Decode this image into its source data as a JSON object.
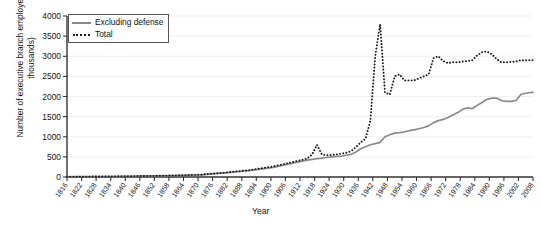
{
  "chart_data": {
    "type": "line",
    "title": "",
    "xlabel": "Year",
    "ylabel": "Number of executive branch employees (in thousands)",
    "xlim": [
      1816,
      2008
    ],
    "ylim": [
      0,
      4000
    ],
    "grid": true,
    "legend_position": "top-left",
    "ytick_labels": [
      "0",
      "500",
      "1000",
      "1500",
      "2000",
      "2500",
      "3000",
      "3500",
      "4000"
    ],
    "ytick_values": [
      0,
      500,
      1000,
      1500,
      2000,
      2500,
      3000,
      3500,
      4000
    ],
    "xtick_labels": [
      "1816",
      "1822",
      "1828",
      "1834",
      "1840",
      "1846",
      "1852",
      "1858",
      "1864",
      "1870",
      "1876",
      "1882",
      "1888",
      "1894",
      "1900",
      "1906",
      "1912",
      "1918",
      "1924",
      "1930",
      "1936",
      "1942",
      "1948",
      "1954",
      "1960",
      "1966",
      "1972",
      "1978",
      "1984",
      "1990",
      "1996",
      "2002",
      "2008"
    ],
    "xtick_values": [
      1816,
      1822,
      1828,
      1834,
      1840,
      1846,
      1852,
      1858,
      1864,
      1870,
      1876,
      1882,
      1888,
      1894,
      1900,
      1906,
      1912,
      1918,
      1924,
      1930,
      1936,
      1942,
      1948,
      1954,
      1960,
      1966,
      1972,
      1978,
      1984,
      1990,
      1996,
      2002,
      2008
    ],
    "series": [
      {
        "name": "Excluding defense",
        "style": "solid",
        "color": "#8a8a8a",
        "x": [
          1816,
          1821,
          1831,
          1841,
          1851,
          1861,
          1871,
          1881,
          1891,
          1901,
          1911,
          1913,
          1915,
          1917,
          1919,
          1921,
          1923,
          1925,
          1927,
          1929,
          1931,
          1933,
          1935,
          1937,
          1939,
          1941,
          1943,
          1945,
          1947,
          1949,
          1951,
          1953,
          1955,
          1957,
          1959,
          1961,
          1963,
          1965,
          1967,
          1969,
          1971,
          1973,
          1975,
          1977,
          1979,
          1981,
          1983,
          1985,
          1987,
          1989,
          1991,
          1993,
          1995,
          1997,
          1999,
          2001,
          2003,
          2005,
          2007,
          2008
        ],
        "y": [
          5,
          7,
          12,
          19,
          26,
          37,
          53,
          100,
          158,
          239,
          368,
          396,
          420,
          438,
          455,
          470,
          485,
          500,
          510,
          520,
          540,
          560,
          620,
          700,
          750,
          800,
          830,
          860,
          1000,
          1050,
          1090,
          1100,
          1120,
          1150,
          1170,
          1200,
          1230,
          1270,
          1350,
          1400,
          1430,
          1480,
          1540,
          1600,
          1680,
          1720,
          1700,
          1780,
          1850,
          1930,
          1960,
          1960,
          1900,
          1880,
          1880,
          1900,
          2050,
          2080,
          2100,
          2100
        ]
      },
      {
        "name": "Total",
        "style": "dotted",
        "color": "#1a1a1a",
        "x": [
          1816,
          1821,
          1831,
          1841,
          1851,
          1861,
          1871,
          1881,
          1891,
          1901,
          1911,
          1913,
          1915,
          1917,
          1919,
          1921,
          1923,
          1925,
          1927,
          1929,
          1931,
          1933,
          1935,
          1937,
          1939,
          1941,
          1943,
          1945,
          1947,
          1949,
          1951,
          1953,
          1955,
          1957,
          1959,
          1961,
          1963,
          1965,
          1967,
          1969,
          1971,
          1973,
          1975,
          1977,
          1979,
          1981,
          1983,
          1985,
          1987,
          1989,
          1991,
          1993,
          1995,
          1997,
          1999,
          2001,
          2003,
          2005,
          2007,
          2008
        ],
        "y": [
          5,
          8,
          13,
          20,
          28,
          40,
          58,
          110,
          170,
          260,
          400,
          430,
          460,
          560,
          800,
          560,
          540,
          550,
          560,
          580,
          600,
          640,
          740,
          860,
          950,
          1400,
          3000,
          3800,
          2100,
          2050,
          2500,
          2550,
          2400,
          2400,
          2400,
          2450,
          2500,
          2550,
          2950,
          3000,
          2880,
          2830,
          2850,
          2850,
          2870,
          2880,
          2900,
          3020,
          3100,
          3120,
          3050,
          2930,
          2850,
          2850,
          2860,
          2870,
          2900,
          2900,
          2900,
          2900
        ]
      }
    ]
  },
  "axis_label_x": "Year",
  "axis_label_y": "Number of executive branch employees (in thousands)"
}
